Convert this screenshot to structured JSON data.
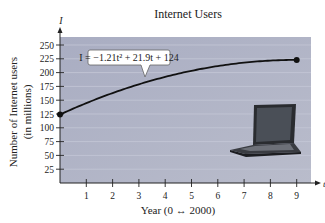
{
  "chart_data": {
    "type": "line",
    "title": "Internet Users",
    "xlabel": "Year (0 ↔ 2000)",
    "ylabel": "Number of Internet users",
    "ylabel_sub": "(in millions)",
    "x_axis_var": "t",
    "y_axis_var": "I",
    "equation_label": "I = −1.21t² + 21.9t + 124",
    "equation": {
      "a": -1.21,
      "b": 21.9,
      "c": 124
    },
    "xlim": [
      0,
      9
    ],
    "ylim": [
      0,
      262
    ],
    "x_ticks": [
      1,
      2,
      3,
      4,
      5,
      6,
      7,
      8,
      9
    ],
    "y_ticks": [
      25,
      50,
      75,
      100,
      125,
      150,
      175,
      200,
      225,
      250
    ],
    "endpoints": [
      {
        "t": 0,
        "I": 124
      },
      {
        "t": 9,
        "I": 223
      }
    ],
    "grid": true,
    "decoration": "laptop-image"
  },
  "colors": {
    "plot_bg": "#aeb1c4",
    "curve": "#111111",
    "grid": "#c4c7d6"
  }
}
